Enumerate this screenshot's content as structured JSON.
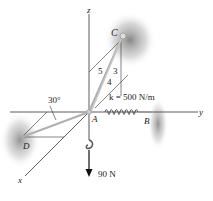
{
  "diagram": {
    "axes": {
      "x": "x",
      "y": "y",
      "z": "z"
    },
    "points": {
      "A": "A",
      "B": "B",
      "C": "C",
      "D": "D"
    },
    "angle_label": "30°",
    "spring_label": "k = 500 N/m",
    "slope_labels": {
      "hyp": "5",
      "vert": "3",
      "horiz": "4"
    },
    "load_label": "90 N",
    "colors": {
      "line": "#333333",
      "cable": "#b8b8b8",
      "shadow": "#8a8a8a"
    }
  }
}
